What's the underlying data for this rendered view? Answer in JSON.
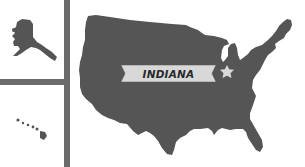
{
  "map": {
    "title": "United States locator map",
    "highlighted_state": {
      "label": "INDIANA",
      "marker": "star-icon"
    },
    "insets": [
      {
        "name": "Alaska"
      },
      {
        "name": "Hawaii"
      }
    ],
    "colors": {
      "land": "#555555",
      "background": "#ffffff",
      "banner": "#d8d8d8",
      "banner_text": "#2a2a2a",
      "star": "#d8d8d8",
      "divider": "#6b6b6b"
    }
  }
}
